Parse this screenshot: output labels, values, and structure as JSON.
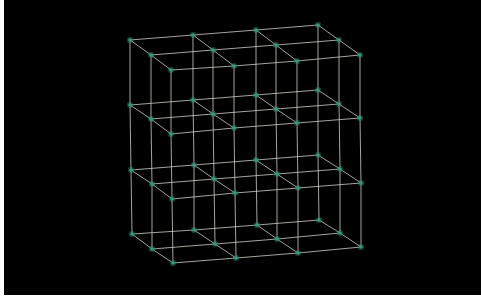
{
  "scene": {
    "title": "3x3x3 lattice wireframe",
    "background": "#000000",
    "edge_color": "#d8d8d0",
    "node_color": "#2f9c7e",
    "grid": {
      "nx": 4,
      "ny": 4,
      "nz": 3
    },
    "layers": [
      {
        "name": "level-1",
        "rows": [
          [
            [
              130,
              40
            ],
            [
              193,
              35
            ],
            [
              256,
              30
            ],
            [
              318,
              25
            ]
          ],
          [
            [
              151,
              55
            ],
            [
              213,
              50
            ],
            [
              276,
              45
            ],
            [
              339,
              40
            ]
          ],
          [
            [
              171,
              70
            ],
            [
              234,
              66
            ],
            [
              297,
              61
            ],
            [
              360,
              55
            ]
          ]
        ]
      },
      {
        "name": "level-2",
        "rows": [
          [
            [
              130,
              105
            ],
            [
              193,
              100
            ],
            [
              256,
              95
            ],
            [
              318,
              90
            ]
          ],
          [
            [
              151,
              119
            ],
            [
              213,
              114
            ],
            [
              276,
              109
            ],
            [
              339,
              104
            ]
          ],
          [
            [
              171,
              134
            ],
            [
              234,
              128
            ],
            [
              297,
              123
            ],
            [
              360,
              118
            ]
          ]
        ]
      },
      {
        "name": "level-3",
        "rows": [
          [
            [
              131,
              170
            ],
            [
              194,
              165
            ],
            [
              256,
              160
            ],
            [
              318,
              155
            ]
          ],
          [
            [
              152,
              184
            ],
            [
              214,
              179
            ],
            [
              277,
              174
            ],
            [
              340,
              169
            ]
          ],
          [
            [
              172,
              199
            ],
            [
              235,
              193
            ],
            [
              298,
              188
            ],
            [
              361,
              183
            ]
          ]
        ]
      },
      {
        "name": "level-4",
        "rows": [
          [
            [
              132,
              234
            ],
            [
              194,
              230
            ],
            [
              257,
              225
            ],
            [
              319,
              220
            ]
          ],
          [
            [
              152,
              249
            ],
            [
              215,
              244
            ],
            [
              277,
              239
            ],
            [
              340,
              233
            ]
          ],
          [
            [
              173,
              263
            ],
            [
              236,
              258
            ],
            [
              298,
              253
            ],
            [
              361,
              247
            ]
          ]
        ]
      }
    ]
  }
}
